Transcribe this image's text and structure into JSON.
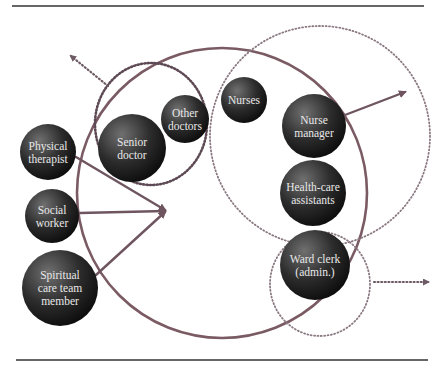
{
  "figure": {
    "top_rule": {
      "x1": 12,
      "x2": 424,
      "y": 6
    },
    "bottom_rule": {
      "x1": 16,
      "x2": 428,
      "y": 360
    },
    "colors": {
      "main_circle": "#7a5a63",
      "dotted": "#6e5a64",
      "arrow": "#6e5560",
      "bubble_light": "#6a6a6a",
      "bubble_dark": "#111111",
      "label_text": "#e8e8e8",
      "rule": "#333333"
    }
  },
  "groups": {
    "ward_team": {
      "label": "Ward team boundary",
      "cx": 222,
      "cy": 193,
      "r": 145
    },
    "doctors": {
      "label": "Doctors group",
      "cx": 151,
      "cy": 124,
      "rx": 56,
      "ry": 61
    },
    "nursing": {
      "label": "Nursing group",
      "cx": 320,
      "cy": 136,
      "r": 110
    },
    "admin": {
      "label": "Admin group",
      "cx": 320,
      "cy": 284,
      "rx": 50,
      "ry": 52
    }
  },
  "bubbles": [
    {
      "id": "physical-therapist",
      "lines": [
        "Physical",
        "therapist"
      ],
      "cx": 48,
      "cy": 152,
      "r": 28
    },
    {
      "id": "social-worker",
      "lines": [
        "Social",
        "worker"
      ],
      "cx": 52,
      "cy": 216,
      "r": 27
    },
    {
      "id": "spiritual-care-team-member",
      "lines": [
        "Spiritual",
        "care team",
        "member"
      ],
      "cx": 60,
      "cy": 288,
      "r": 38
    },
    {
      "id": "senior-doctor",
      "lines": [
        "Senior",
        "doctor"
      ],
      "cx": 132,
      "cy": 148,
      "r": 34
    },
    {
      "id": "other-doctors",
      "lines": [
        "Other",
        "doctors"
      ],
      "cx": 185,
      "cy": 119,
      "r": 24
    },
    {
      "id": "nurses",
      "lines": [
        "Nurses"
      ],
      "cx": 244,
      "cy": 100,
      "r": 23
    },
    {
      "id": "nurse-manager",
      "lines": [
        "Nurse",
        "manager"
      ],
      "cx": 314,
      "cy": 126,
      "r": 32
    },
    {
      "id": "health-care-assistants",
      "lines": [
        "Health-care",
        "assistants"
      ],
      "cx": 313,
      "cy": 193,
      "r": 33
    },
    {
      "id": "ward-clerk",
      "lines": [
        "Ward clerk",
        "(admin.)"
      ],
      "cx": 315,
      "cy": 265,
      "r": 35
    }
  ],
  "arrows": [
    {
      "id": "physical-therapist-arrow",
      "style": "solid",
      "from": [
        76,
        157
      ],
      "to": [
        165,
        210
      ]
    },
    {
      "id": "social-worker-arrow",
      "style": "solid",
      "from": [
        80,
        213
      ],
      "to": [
        165,
        211
      ]
    },
    {
      "id": "spiritual-care-arrow",
      "style": "solid",
      "from": [
        96,
        275
      ],
      "to": [
        165,
        212
      ]
    },
    {
      "id": "nurse-manager-outward-arrow",
      "style": "solid",
      "from": [
        345,
        115
      ],
      "to": [
        405,
        92
      ]
    },
    {
      "id": "doctors-outward-arrow",
      "style": "dotted",
      "from": [
        108,
        86
      ],
      "to": [
        71,
        56
      ]
    },
    {
      "id": "admin-outward-arrow",
      "style": "dotted",
      "from": [
        374,
        282
      ],
      "to": [
        428,
        282
      ]
    }
  ]
}
